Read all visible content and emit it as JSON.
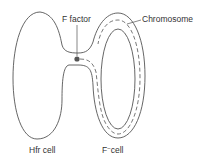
{
  "diagram": {
    "labels": {
      "f_factor": "F factor",
      "chromosome": "Chromosome",
      "hfr_cell": "Hfr cell",
      "f_minus_cell_prefix": "F",
      "f_minus_cell_sup": "−",
      "f_minus_cell_suffix": "cell"
    },
    "colors": {
      "stroke": "#555555",
      "dot": "#555555",
      "text": "#333333",
      "background": "#ffffff"
    }
  }
}
